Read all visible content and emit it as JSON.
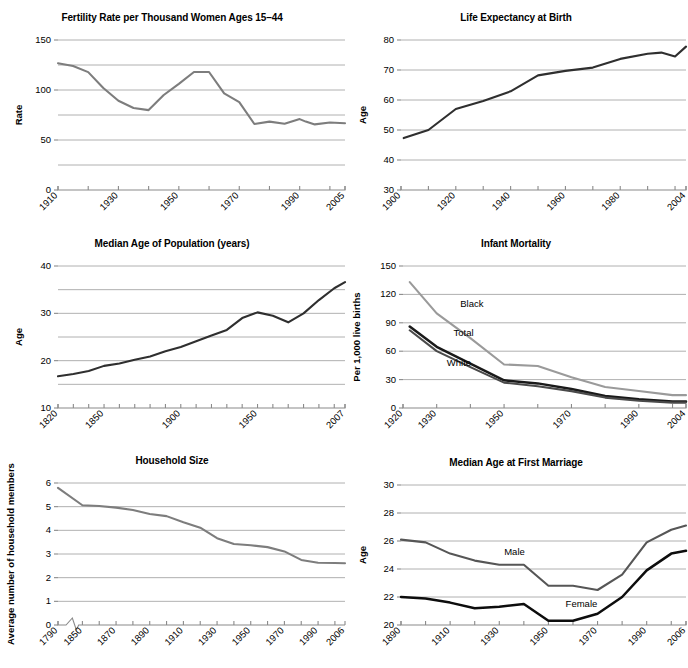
{
  "figure": {
    "panel_count": 6,
    "background": "#ffffff",
    "line_colors": {
      "gray": "#7d7d7d",
      "dark_gray": "#565656",
      "black": "#0d0d0d",
      "gridline": "#9c9c9c"
    }
  },
  "chart_data": [
    {
      "id": "fertility-rate",
      "type": "line",
      "title": "Fertility Rate per Thousand Women Ages 15–44",
      "xlabel": "",
      "ylabel": "Rate",
      "ylim": [
        0,
        150
      ],
      "yticks": [
        0,
        50,
        100,
        150
      ],
      "ygrid": [
        25,
        50,
        75,
        100,
        125,
        150
      ],
      "grid": true,
      "xlim": [
        1910,
        2005
      ],
      "xticks": [
        1910,
        1920,
        1930,
        1940,
        1950,
        1960,
        1970,
        1980,
        1990,
        2000,
        2005
      ],
      "xticklabels": [
        "1910",
        "1930",
        "1950",
        "1970",
        "1990",
        "2005"
      ],
      "xticklabel_values": [
        1910,
        1930,
        1950,
        1970,
        1990,
        2005
      ],
      "series": [
        {
          "name": "Fertility rate",
          "color": "#7d7d7d",
          "x": [
            1910,
            1915,
            1920,
            1925,
            1930,
            1935,
            1940,
            1945,
            1950,
            1955,
            1960,
            1965,
            1970,
            1975,
            1980,
            1985,
            1990,
            1992,
            1995,
            2000,
            2005
          ],
          "values": [
            126.8,
            124.0,
            117.9,
            102.0,
            89.2,
            82.0,
            79.9,
            95.0,
            106.2,
            118.0,
            118.0,
            96.6,
            87.9,
            66.0,
            68.4,
            66.2,
            70.9,
            68.4,
            65.6,
            67.5,
            66.7
          ]
        }
      ]
    },
    {
      "id": "life-expectancy",
      "type": "line",
      "title": "Life Expectancy at Birth",
      "xlabel": "",
      "ylabel": "Age",
      "ylim": [
        30,
        80
      ],
      "yticks": [
        30,
        40,
        50,
        60,
        70,
        80
      ],
      "ygrid": [
        40,
        50,
        60,
        70,
        80
      ],
      "grid": true,
      "xlim": [
        1900,
        2004
      ],
      "xticks": [
        1900,
        1910,
        1920,
        1930,
        1940,
        1950,
        1960,
        1970,
        1980,
        1990,
        2000,
        2004
      ],
      "xticklabels": [
        "1900",
        "1920",
        "1940",
        "1960",
        "1980",
        "2004"
      ],
      "xticklabel_values": [
        1900,
        1920,
        1940,
        1960,
        1980,
        2004
      ],
      "series": [
        {
          "name": "Life expectancy",
          "color": "#2f2f2f",
          "x": [
            1901,
            1910,
            1920,
            1930,
            1940,
            1950,
            1960,
            1970,
            1980,
            1990,
            1995,
            2000,
            2004
          ],
          "values": [
            47.3,
            50.0,
            57.0,
            59.7,
            62.9,
            68.2,
            69.7,
            70.8,
            73.7,
            75.4,
            75.8,
            74.5,
            77.8
          ]
        }
      ]
    },
    {
      "id": "median-age-population",
      "type": "line",
      "title": "Median Age of Population (years)",
      "xlabel": "",
      "ylabel": "Age",
      "ylim": [
        10,
        40
      ],
      "yticks": [
        10,
        20,
        30,
        40
      ],
      "ygrid": [
        15,
        20,
        25,
        30,
        35,
        40
      ],
      "grid": true,
      "xlim": [
        1820,
        2007
      ],
      "xticks": [
        1820,
        1830,
        1840,
        1850,
        1860,
        1870,
        1880,
        1890,
        1900,
        1910,
        1920,
        1930,
        1940,
        1950,
        1960,
        1970,
        1980,
        1990,
        2000,
        2007
      ],
      "xticklabels": [
        "1820",
        "1850",
        "1900",
        "1950",
        "2007"
      ],
      "xticklabel_values": [
        1820,
        1850,
        1900,
        1950,
        2007
      ],
      "series": [
        {
          "name": "Median age",
          "color": "#2f2f2f",
          "x": [
            1820,
            1830,
            1840,
            1850,
            1860,
            1870,
            1880,
            1890,
            1900,
            1910,
            1920,
            1930,
            1940,
            1950,
            1960,
            1970,
            1980,
            1990,
            2000,
            2007
          ],
          "values": [
            16.7,
            17.2,
            17.8,
            18.9,
            19.4,
            20.2,
            20.9,
            22.0,
            22.9,
            24.1,
            25.3,
            26.5,
            29.0,
            30.2,
            29.5,
            28.1,
            30.0,
            32.8,
            35.3,
            36.6
          ]
        }
      ]
    },
    {
      "id": "infant-mortality",
      "type": "line",
      "title": "Infant Mortality",
      "xlabel": "",
      "ylabel": "Per 1,000 live births",
      "ylim": [
        0,
        150
      ],
      "yticks": [
        0,
        30,
        60,
        90,
        120,
        150
      ],
      "ygrid": [
        30,
        60,
        90,
        120,
        150
      ],
      "grid": true,
      "xlim": [
        1920,
        2004
      ],
      "xticks": [
        1920,
        1930,
        1940,
        1950,
        1960,
        1970,
        1980,
        1990,
        2000,
        2004
      ],
      "xticklabels": [
        "1920",
        "1930",
        "1950",
        "1970",
        "1990",
        "2004"
      ],
      "xticklabel_values": [
        1920,
        1930,
        1950,
        1970,
        1990,
        2004
      ],
      "series": [
        {
          "name": "Black",
          "color": "#9a9a9a",
          "x": [
            1922,
            1930,
            1940,
            1950,
            1960,
            1970,
            1980,
            1990,
            2000,
            2004
          ],
          "values": [
            133.0,
            99.9,
            73.8,
            46.0,
            44.3,
            32.6,
            22.2,
            18.0,
            13.6,
            13.6
          ]
        },
        {
          "name": "Total",
          "color": "#1a1a1a",
          "x": [
            1922,
            1930,
            1940,
            1950,
            1960,
            1970,
            1980,
            1990,
            2000,
            2004
          ],
          "values": [
            86.0,
            64.6,
            47.0,
            29.2,
            26.0,
            20.0,
            12.6,
            9.2,
            6.9,
            6.8
          ]
        },
        {
          "name": "White",
          "color": "#4a4a4a",
          "x": [
            1922,
            1930,
            1940,
            1950,
            1960,
            1970,
            1980,
            1990,
            2000,
            2004
          ],
          "values": [
            82.1,
            60.1,
            43.2,
            26.8,
            22.9,
            17.8,
            11.0,
            7.6,
            5.7,
            5.7
          ]
        }
      ],
      "annotations": [
        {
          "text": "Black",
          "x": 1937,
          "y": 107
        },
        {
          "text": "Total",
          "x": 1935,
          "y": 76
        },
        {
          "text": "White",
          "x": 1933,
          "y": 44
        }
      ]
    },
    {
      "id": "household-size",
      "type": "line",
      "title": "Household Size",
      "xlabel": "",
      "ylabel": "Average number of household members",
      "ylim": [
        0,
        6
      ],
      "yticks": [
        0,
        1,
        2,
        3,
        4,
        5,
        6
      ],
      "ygrid": [
        1,
        2,
        3,
        4,
        5,
        6
      ],
      "grid": true,
      "axis_break": true,
      "axis_break_note": "break in x-axis between 1790 and 1850",
      "xlim": [
        1790,
        2006
      ],
      "xticklabels": [
        "1790",
        "1850",
        "1870",
        "1890",
        "1910",
        "1930",
        "1950",
        "1970",
        "1990",
        "2006"
      ],
      "xticklabel_values": [
        1790,
        1850,
        1870,
        1890,
        1910,
        1930,
        1950,
        1970,
        1990,
        2006
      ],
      "series": [
        {
          "name": "Household size",
          "color": "#7d7d7d",
          "x": [
            1790,
            1850,
            1860,
            1870,
            1880,
            1890,
            1900,
            1910,
            1920,
            1930,
            1940,
            1950,
            1960,
            1970,
            1980,
            1990,
            2000,
            2006
          ],
          "values": [
            5.79,
            5.06,
            5.03,
            4.96,
            4.86,
            4.69,
            4.6,
            4.34,
            4.11,
            3.67,
            3.42,
            3.37,
            3.29,
            3.11,
            2.75,
            2.63,
            2.62,
            2.61
          ]
        }
      ]
    },
    {
      "id": "median-age-first-marriage",
      "type": "line",
      "title": "Median Age at First Marriage",
      "xlabel": "",
      "ylabel": "Age",
      "ylim": [
        20,
        30
      ],
      "yticks": [
        20,
        22,
        24,
        26,
        28,
        30
      ],
      "ygrid": [
        22,
        24,
        26,
        28,
        30
      ],
      "grid": true,
      "xlim": [
        1890,
        2006
      ],
      "xticks": [
        1890,
        1900,
        1910,
        1920,
        1930,
        1940,
        1950,
        1960,
        1970,
        1980,
        1990,
        2000,
        2006
      ],
      "xticklabels": [
        "1890",
        "1910",
        "1930",
        "1950",
        "1970",
        "1990",
        "2006"
      ],
      "xticklabel_values": [
        1890,
        1910,
        1930,
        1950,
        1970,
        1990,
        2006
      ],
      "series": [
        {
          "name": "Male",
          "color": "#565656",
          "x": [
            1890,
            1900,
            1910,
            1920,
            1930,
            1940,
            1950,
            1960,
            1970,
            1980,
            1990,
            2000,
            2006
          ],
          "values": [
            26.1,
            25.9,
            25.1,
            24.6,
            24.3,
            24.3,
            22.8,
            22.8,
            22.5,
            23.6,
            25.9,
            26.8,
            27.1
          ]
        },
        {
          "name": "Female",
          "color": "#0d0d0d",
          "x": [
            1890,
            1900,
            1910,
            1920,
            1930,
            1940,
            1950,
            1960,
            1970,
            1980,
            1990,
            2000,
            2006
          ],
          "values": [
            22.0,
            21.9,
            21.6,
            21.2,
            21.3,
            21.5,
            20.3,
            20.3,
            20.8,
            22.0,
            23.9,
            25.1,
            25.3
          ]
        }
      ],
      "annotations": [
        {
          "text": "Male",
          "x": 1932,
          "y": 25.0
        },
        {
          "text": "Female",
          "x": 1957,
          "y": 21.3
        }
      ]
    }
  ]
}
